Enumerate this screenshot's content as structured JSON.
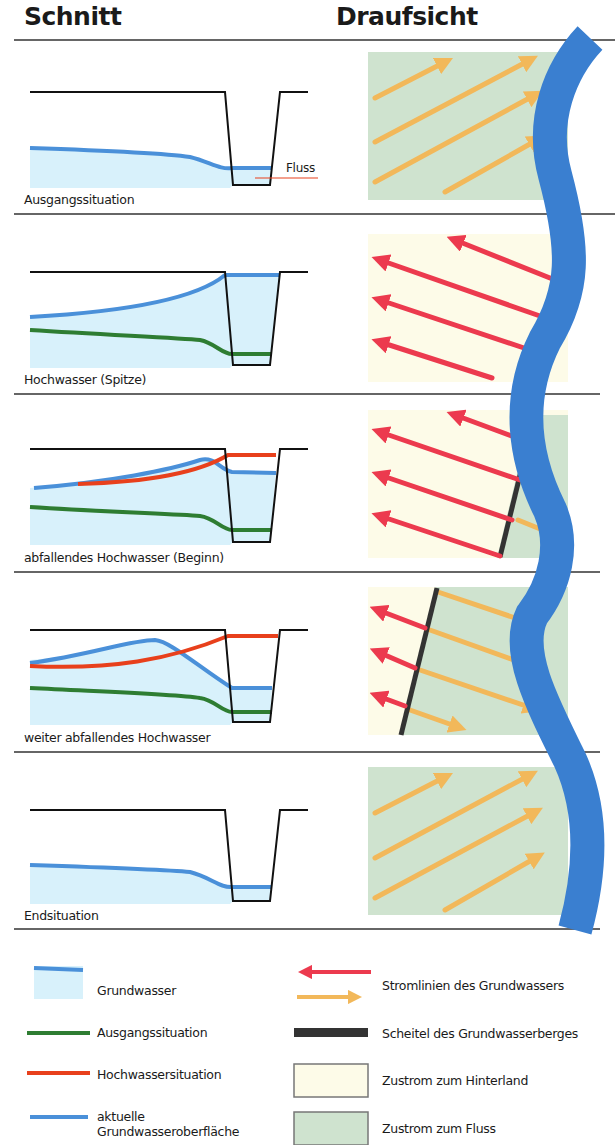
{
  "headers": {
    "section": "Schnitt",
    "plan": "Draufsicht"
  },
  "colors": {
    "groundwater_fill": "#d8f1fb",
    "current_surface": "#4a90d9",
    "initial_situation": "#2e7d32",
    "flood_situation": "#e8401c",
    "river": "#3a7fd0",
    "stream_to_hinterland": "#ec3a4e",
    "stream_to_river": "#f2b85a",
    "crest": "#333333",
    "zone_hinterland": "#fdfbe8",
    "zone_river": "#cfe3cf",
    "ground": "#111111"
  },
  "panels": [
    {
      "caption": "Ausgangssituation",
      "plan_flow": "to_river",
      "extra_label": "Fluss"
    },
    {
      "caption": "Hochwasser (Spitze)",
      "plan_flow": "to_hinterland"
    },
    {
      "caption": "abfallendes Hochwasser (Beginn)",
      "plan_flow": "mixed_crest_near_river"
    },
    {
      "caption": "weiter abfallendes Hochwasser",
      "plan_flow": "mixed_crest_far"
    },
    {
      "caption": "Endsituation",
      "plan_flow": "to_river"
    }
  ],
  "legend": {
    "left": [
      {
        "icon": "groundwater-swatch",
        "label": "Grundwasser"
      },
      {
        "icon": "green-line",
        "label": "Ausgangssituation"
      },
      {
        "icon": "red-line",
        "label": "Hochwassersituation"
      },
      {
        "icon": "blue-line",
        "label": "aktuelle Grundwasseroberfläche"
      }
    ],
    "right": [
      {
        "icon": "streamline-arrows",
        "label": "Stromlinien des Grundwassers"
      },
      {
        "icon": "crest-bar",
        "label": "Scheitel des Grundwasserberges"
      },
      {
        "icon": "hinterland-swatch",
        "label": "Zustrom zum Hinterland"
      },
      {
        "icon": "river-swatch",
        "label": "Zustrom zum Fluss"
      }
    ]
  }
}
